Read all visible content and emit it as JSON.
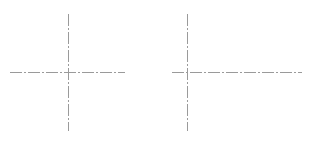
{
  "diagram": {
    "type": "centerline-marks",
    "line_color": "#9a9a9a",
    "dash_pattern": "12 2 2 2",
    "crosses": [
      {
        "cx": 68,
        "cy": 72,
        "h_from": 10,
        "h_to": 125,
        "v_from": 14,
        "v_to": 131
      },
      {
        "cx": 187,
        "cy": 72,
        "h_from": 172,
        "h_to": 302,
        "v_from": 14,
        "v_to": 131
      }
    ]
  }
}
